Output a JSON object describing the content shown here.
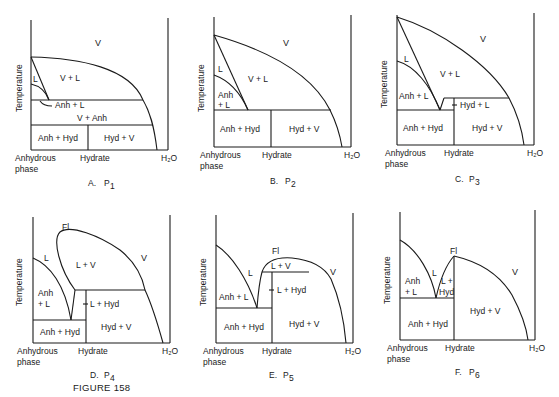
{
  "figure": {
    "title": "FIGURE 158",
    "axis": {
      "ylabel": "Temperature",
      "x_left": [
        "Anhydrous",
        "phase"
      ],
      "x_mid": "Hydrate",
      "x_right": "H₂O"
    },
    "panels": [
      {
        "id": "A",
        "caption_letter": "A.",
        "caption_p": "P",
        "caption_sub": "1",
        "regions": [
          "V",
          "V + L",
          "L",
          "Anh + L",
          "V + Anh",
          "Anh + Hyd",
          "Hyd + V"
        ]
      },
      {
        "id": "B",
        "caption_letter": "B.",
        "caption_p": "P",
        "caption_sub": "2",
        "regions": [
          "V",
          "L",
          "V + L",
          "Anh",
          "+ L",
          "Anh + Hyd",
          "Hyd + V"
        ]
      },
      {
        "id": "C",
        "caption_letter": "C.",
        "caption_p": "P",
        "caption_sub": "3",
        "regions": [
          "V",
          "L",
          "V + L",
          "Anh + L",
          "Hyd + L",
          "Anh + Hyd",
          "Hyd + V"
        ]
      },
      {
        "id": "D",
        "caption_letter": "D.",
        "caption_p": "P",
        "caption_sub": "4",
        "regions": [
          "Fl",
          "L",
          "L + V",
          "V",
          "Anh",
          "+ L",
          "L + Hyd",
          "Anh + Hyd",
          "Hyd + V"
        ]
      },
      {
        "id": "E",
        "caption_letter": "E.",
        "caption_p": "P",
        "caption_sub": "5",
        "regions": [
          "Fl",
          "L",
          "L + V",
          "V",
          "Anh + L",
          "L + Hyd",
          "Anh + Hyd",
          "Hyd + V"
        ]
      },
      {
        "id": "F",
        "caption_letter": "F.",
        "caption_p": "P",
        "caption_sub": "6",
        "regions": [
          "Fl",
          "L",
          "V",
          "Anh",
          "+ L",
          "L +",
          "Hyd",
          "Hyd + V",
          "Anh + Hyd"
        ]
      }
    ]
  }
}
